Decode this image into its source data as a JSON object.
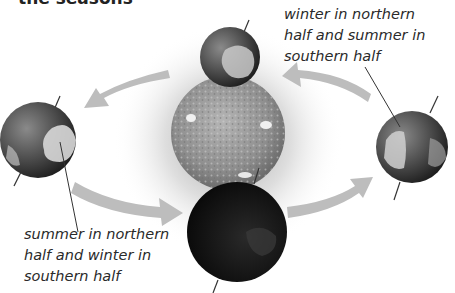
{
  "title": "the seasons",
  "labels": {
    "top_right": [
      "winter in northern",
      "half and summer in",
      "southern half"
    ],
    "bottom_left": [
      "summer in northern",
      "half and winter in",
      "southern half"
    ]
  },
  "bodies": {
    "sun": {
      "name": "Sun",
      "cx": 228,
      "cy": 133,
      "r": 57
    },
    "earth_left": {
      "name": "Earth (left position)",
      "cx": 38,
      "cy": 140,
      "r": 38
    },
    "earth_right": {
      "name": "Earth (right position)",
      "cx": 412,
      "cy": 147,
      "r": 36
    },
    "earth_top": {
      "name": "Earth (top position)",
      "cx": 230,
      "cy": 57,
      "r": 30
    },
    "earth_bottom": {
      "name": "Earth (bottom position)",
      "cx": 237,
      "cy": 232,
      "r": 50
    }
  },
  "colors": {
    "background": "#ffffff",
    "arrow": "#bdbdbd",
    "text": "#2a2a2a",
    "sun": "#9a9a9a",
    "earth_dark": "#1a1a1a",
    "earth_land": "#d8d8d8"
  }
}
